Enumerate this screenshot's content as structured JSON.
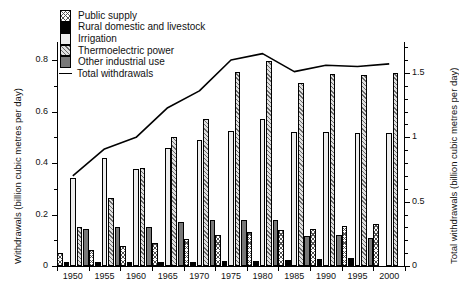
{
  "axes": {
    "left_title": "Withdrawals (billion cubic metres per day)",
    "right_title": "Total withdrawals (billion cubic metres per day)",
    "left_ticks": [
      "0",
      "0.2",
      "0.4",
      "0.6",
      "0.8"
    ],
    "right_ticks": [
      "0",
      "0.5",
      "1",
      "1.5"
    ]
  },
  "legend": {
    "items": [
      {
        "label": "Public supply",
        "swatch": "public-supply-swatch"
      },
      {
        "label": "Rural domestic and livestock",
        "swatch": "rural-swatch"
      },
      {
        "label": "Irrigation",
        "swatch": "irrigation-swatch"
      },
      {
        "label": "Thermoelectric power",
        "swatch": "thermoelectric-swatch"
      },
      {
        "label": "Other industrial use",
        "swatch": "other-industrial-swatch"
      }
    ],
    "line_label": "Total withdrawals"
  },
  "chart_data": {
    "type": "bar",
    "title": "",
    "xlabel": "",
    "ylabel": "Withdrawals (billion cubic metres per day)",
    "y2label": "Total withdrawals (billion cubic metres per day)",
    "ylim": [
      0,
      0.87
    ],
    "y2lim": [
      0,
      1.74
    ],
    "grid": false,
    "legend_position": "top-left",
    "categories": [
      "1950",
      "1955",
      "1960",
      "1965",
      "1970",
      "1975",
      "1980",
      "1985",
      "1990",
      "1995",
      "2000"
    ],
    "series": [
      {
        "name": "Public supply",
        "values": [
          0.052,
          0.064,
          0.077,
          0.089,
          0.104,
          0.12,
          0.131,
          0.139,
          0.145,
          0.155,
          0.164
        ]
      },
      {
        "name": "Rural domestic and livestock",
        "values": [
          0.014,
          0.014,
          0.014,
          0.015,
          0.016,
          0.018,
          0.02,
          0.024,
          0.028,
          0.03,
          0.0
        ]
      },
      {
        "name": "Irrigation",
        "values": [
          0.34,
          0.42,
          0.377,
          0.458,
          0.49,
          0.525,
          0.57,
          0.52,
          0.52,
          0.515,
          0.515
        ]
      },
      {
        "name": "Thermoelectric power",
        "values": [
          0.15,
          0.265,
          0.38,
          0.5,
          0.57,
          0.755,
          0.795,
          0.71,
          0.745,
          0.74,
          0.748
        ]
      },
      {
        "name": "Other industrial use",
        "values": [
          0.145,
          0.15,
          0.15,
          0.17,
          0.18,
          0.18,
          0.18,
          0.115,
          0.12,
          0.11,
          0.0
        ]
      }
    ],
    "line_series": {
      "name": "Total withdrawals",
      "axis": "right",
      "values": [
        0.7,
        0.91,
        1.0,
        1.23,
        1.36,
        1.6,
        1.65,
        1.51,
        1.56,
        1.55,
        1.57
      ]
    }
  }
}
